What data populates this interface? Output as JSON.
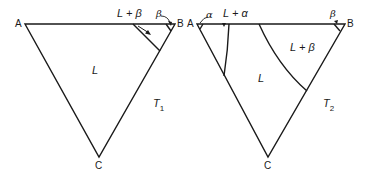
{
  "diagram": {
    "stroke_color": "#1a1a1a",
    "triangles": [
      {
        "id": "T1",
        "label": "T",
        "subscript": "1",
        "vertices": {
          "A": "A",
          "B": "B",
          "C": "C"
        },
        "regions": [
          {
            "name": "L",
            "text": "L"
          },
          {
            "name": "L+beta",
            "text": "L + β"
          },
          {
            "name": "beta",
            "text": "β"
          }
        ]
      },
      {
        "id": "T2",
        "label": "T",
        "subscript": "2",
        "vertices": {
          "A": "A",
          "B": "B",
          "C": "C"
        },
        "regions": [
          {
            "name": "alpha",
            "text": "α"
          },
          {
            "name": "L+alpha",
            "text": "L + α"
          },
          {
            "name": "L",
            "text": "L"
          },
          {
            "name": "L+beta",
            "text": "L + β"
          },
          {
            "name": "beta",
            "text": "β"
          }
        ]
      }
    ]
  }
}
